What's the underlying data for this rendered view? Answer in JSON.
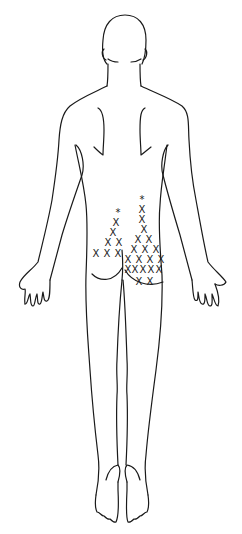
{
  "diagram": {
    "view": "posterior body outline",
    "colors": {
      "line": "#1a1a1a",
      "background": "#ffffff"
    },
    "marker_legend": {
      "x": "X",
      "star": "*"
    },
    "markers": [
      {
        "type": "star",
        "symbol": "*",
        "x": 118,
        "y": 212,
        "group": "left"
      },
      {
        "type": "x",
        "symbol": "X",
        "x": 116,
        "y": 222,
        "group": "left"
      },
      {
        "type": "x",
        "symbol": "X",
        "x": 113,
        "y": 232,
        "group": "left"
      },
      {
        "type": "x",
        "symbol": "X",
        "x": 108,
        "y": 242,
        "group": "left"
      },
      {
        "type": "x",
        "symbol": "X",
        "x": 119,
        "y": 242,
        "group": "left"
      },
      {
        "type": "x",
        "symbol": "X",
        "x": 96,
        "y": 253,
        "group": "left"
      },
      {
        "type": "x",
        "symbol": "X",
        "x": 107,
        "y": 253,
        "group": "left"
      },
      {
        "type": "x",
        "symbol": "X",
        "x": 118,
        "y": 253,
        "group": "left"
      },
      {
        "type": "star",
        "symbol": "*",
        "x": 142,
        "y": 199,
        "group": "right"
      },
      {
        "type": "x",
        "symbol": "X",
        "x": 142,
        "y": 209,
        "group": "right"
      },
      {
        "type": "x",
        "symbol": "X",
        "x": 142,
        "y": 219,
        "group": "right"
      },
      {
        "type": "x",
        "symbol": "X",
        "x": 144,
        "y": 229,
        "group": "right"
      },
      {
        "type": "x",
        "symbol": "X",
        "x": 138,
        "y": 239,
        "group": "right"
      },
      {
        "type": "x",
        "symbol": "X",
        "x": 149,
        "y": 239,
        "group": "right"
      },
      {
        "type": "x",
        "symbol": "X",
        "x": 134,
        "y": 249,
        "group": "right"
      },
      {
        "type": "x",
        "symbol": "X",
        "x": 145,
        "y": 249,
        "group": "right"
      },
      {
        "type": "x",
        "symbol": "X",
        "x": 156,
        "y": 249,
        "group": "right"
      },
      {
        "type": "x",
        "symbol": "X",
        "x": 128,
        "y": 259,
        "group": "right"
      },
      {
        "type": "x",
        "symbol": "X",
        "x": 139,
        "y": 259,
        "group": "right"
      },
      {
        "type": "x",
        "symbol": "X",
        "x": 150,
        "y": 259,
        "group": "right"
      },
      {
        "type": "x",
        "symbol": "X",
        "x": 161,
        "y": 259,
        "group": "right"
      },
      {
        "type": "x",
        "symbol": "X",
        "x": 128,
        "y": 269,
        "group": "right"
      },
      {
        "type": "x",
        "symbol": "X",
        "x": 135,
        "y": 269,
        "group": "right"
      },
      {
        "type": "x",
        "symbol": "X",
        "x": 143,
        "y": 269,
        "group": "right"
      },
      {
        "type": "x",
        "symbol": "X",
        "x": 151,
        "y": 269,
        "group": "right"
      },
      {
        "type": "x",
        "symbol": "X",
        "x": 159,
        "y": 269,
        "group": "right"
      },
      {
        "type": "x",
        "symbol": "X",
        "x": 139,
        "y": 281,
        "group": "right"
      },
      {
        "type": "x",
        "symbol": "X",
        "x": 150,
        "y": 281,
        "group": "right"
      }
    ]
  }
}
